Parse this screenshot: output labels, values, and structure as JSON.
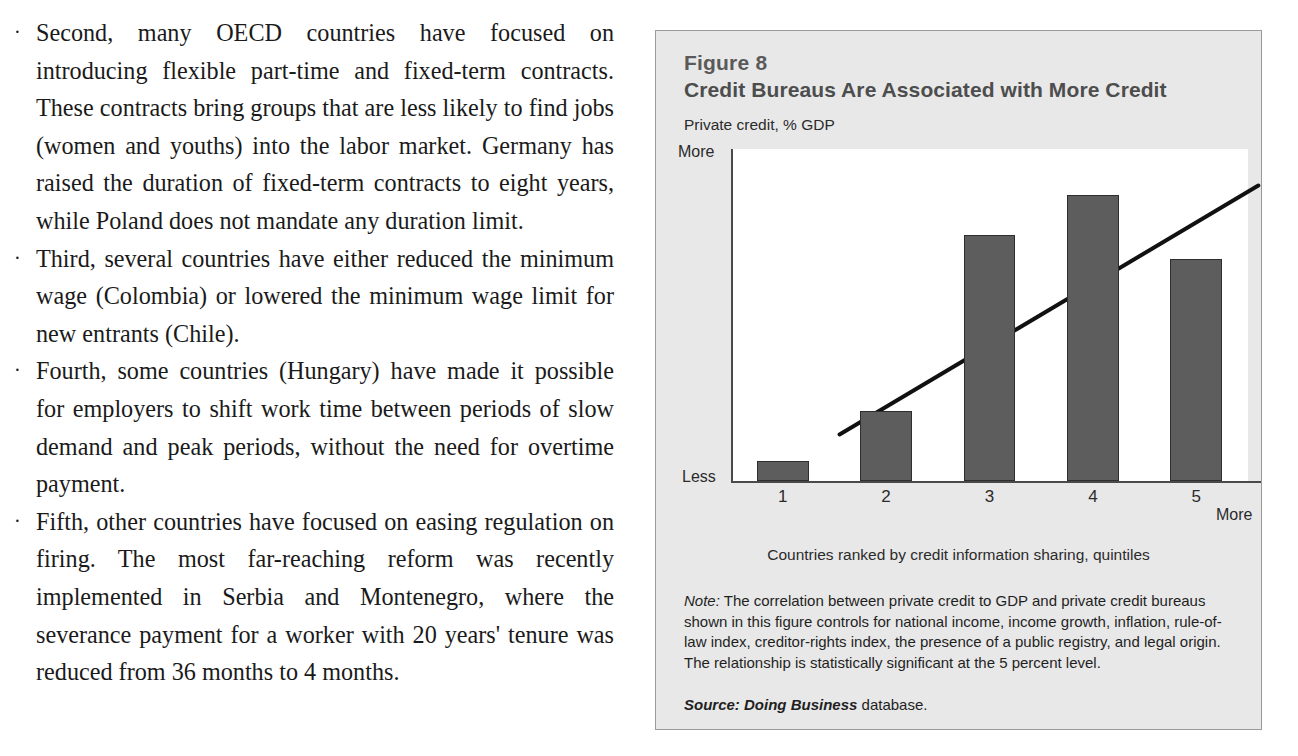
{
  "article": {
    "bullets": [
      "Second, many OECD countries have focused on introducing flexible part-time and fixed-term contracts. These contracts bring groups that are less likely to find jobs (women and youths) into the labor market. Germany has raised the duration of fixed-term contracts to eight years, while Poland does not mandate any duration limit.",
      "Third, several countries have either reduced the minimum wage (Colombia) or lowered the minimum wage limit for new entrants (Chile).",
      "Fourth, some countries (Hungary) have made it possible for employers to shift work time between periods of slow demand and peak periods, without the need for overtime payment.",
      "Fifth, other countries have focused on easing regulation on firing. The most far-reaching reform was recently implemented in Serbia and Montenegro, where the severance payment for a worker with 20 years' tenure was reduced from 36 months to 4 months."
    ],
    "bullet_marker": "·"
  },
  "figure": {
    "number": "Figure 8",
    "title": "Credit Bureaus Are Associated with More Credit",
    "note_label": "Note:",
    "note_text": " The correlation between private credit to GDP and private credit bureaus shown in this figure controls for national income, income growth, inflation, rule-of-law index, creditor-rights index, the presence of a public registry, and legal origin. The relationship is statistically significant at the 5 percent level.",
    "source_label": "Source:",
    "source_db": " Doing Business",
    "source_tail": " database.",
    "background_color": "#e8e8e8",
    "border_color": "#9a9a9a",
    "bar_color": "#5d5d5d",
    "bar_edge_color": "#2e2e2e",
    "axis_color": "#4a4a4a"
  },
  "chart_data": {
    "type": "bar",
    "title": "Credit Bureaus Are Associated with More Credit",
    "subtitle": "Private credit, % GDP",
    "ylabel": "Private credit, % GDP",
    "xlabel": "Countries ranked by credit information sharing, quintiles",
    "categories": [
      "1",
      "2",
      "3",
      "4",
      "5"
    ],
    "values": [
      6,
      21,
      74,
      86,
      67
    ],
    "ylim": [
      0,
      100
    ],
    "y_axis_low_label": "Less",
    "y_axis_high_label": "More",
    "x_axis_high_label": "More",
    "grid": false,
    "legend": null,
    "annotations": [
      {
        "type": "trendline",
        "description": "upward-sloping fitted regression line",
        "x_start_pct": 21,
        "y_start_pct": 14,
        "x_end_pct": 102,
        "y_end_pct": 89
      }
    ]
  }
}
